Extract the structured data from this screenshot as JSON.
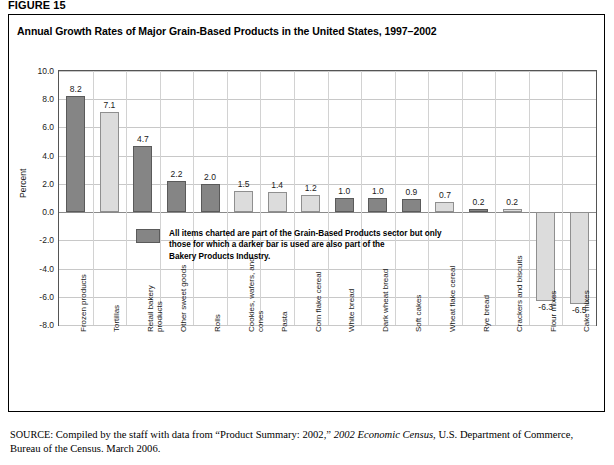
{
  "figure": {
    "label": "FIGURE 15",
    "title": "Annual Growth Rates of Major Grain-Based Products in the United States, 1997–2002"
  },
  "annotation": {
    "swatch_name": "dark-bar-swatch",
    "text": "All items charted are part of the Grain-Based Products sector but only\nthose for which a darker bar is used are also part of the\nBakery Products Industry."
  },
  "source": {
    "prefix": "SOURCE",
    "part1": ": Compiled by the staff with data from “Product Summary: 2002,” ",
    "italic": "2002 Economic Census",
    "part2": ", U.S. Department of Commerce, Bureau of the Census. March 2006."
  },
  "colors": {
    "dark_bar": "#858585",
    "light_bar": "#dcdcdc",
    "dark_bar_border": "#5a5a5a",
    "light_bar_border": "#8f8f8f",
    "grid": "#c8c8c8",
    "axis": "#555555",
    "text": "#1a1a1a"
  },
  "chart_data": {
    "type": "bar",
    "title": "Annual Growth Rates of Major Grain-Based Products in the United States, 1997–2002",
    "xlabel": "",
    "ylabel": "Percent",
    "ylim": [
      -8.0,
      10.0
    ],
    "yticks": [
      "10.0",
      "8.0",
      "6.0",
      "4.0",
      "2.0",
      "0.0",
      "-2.0",
      "-4.0",
      "-6.0",
      "-8.0"
    ],
    "ytick_values": [
      10.0,
      8.0,
      6.0,
      4.0,
      2.0,
      0.0,
      -2.0,
      -4.0,
      -6.0,
      -8.0
    ],
    "grid": true,
    "legend": "none",
    "categories": [
      "Frozen products",
      "Tortillas",
      "Retail bakery\nproducts",
      "Other sweet goods",
      "Rolls",
      "Cookies, wafers, and\ncones",
      "Pasta",
      "Corn flake cereal",
      "White bread",
      "Dark wheat bread",
      "Soft cakes",
      "Wheat flake cereal",
      "Rye bread",
      "Crackers and biscuits",
      "Flour mixes",
      "Cake mixes"
    ],
    "values": [
      8.2,
      7.1,
      4.7,
      2.2,
      2.0,
      1.5,
      1.4,
      1.2,
      1.0,
      1.0,
      0.9,
      0.7,
      0.2,
      0.2,
      -6.3,
      -6.5
    ],
    "value_labels": [
      "8.2",
      "7.1",
      "4.7",
      "2.2",
      "2.0",
      "1.5",
      "1.4",
      "1.2",
      "1.0",
      "1.0",
      "0.9",
      "0.7",
      "0.2",
      "0.2",
      "-6.3",
      "-6.5"
    ],
    "shades": [
      "dark",
      "light",
      "dark",
      "dark",
      "dark",
      "light",
      "light",
      "light",
      "dark",
      "dark",
      "dark",
      "light",
      "dark",
      "light",
      "light",
      "light"
    ],
    "series": [
      {
        "name": "Annual growth rate (percent)",
        "values": [
          8.2,
          7.1,
          4.7,
          2.2,
          2.0,
          1.5,
          1.4,
          1.2,
          1.0,
          1.0,
          0.9,
          0.7,
          0.2,
          0.2,
          -6.3,
          -6.5
        ]
      }
    ]
  }
}
